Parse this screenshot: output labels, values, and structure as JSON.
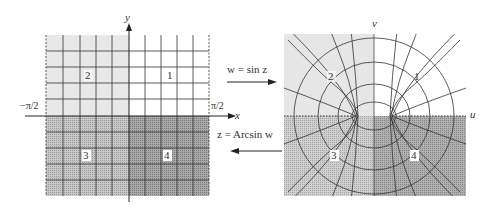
{
  "figure": {
    "left_plane": {
      "name": "z-plane",
      "x_axis_label": "x",
      "y_axis_label": "y",
      "left_bound_label": "−π/2",
      "right_bound_label": "π/2",
      "quadrants": [
        "1",
        "2",
        "3",
        "4"
      ]
    },
    "right_plane": {
      "name": "w-plane",
      "u_axis_label": "u",
      "v_axis_label": "v",
      "quadrants": [
        "1",
        "2",
        "3",
        "4"
      ]
    },
    "forward_map": {
      "label": "w = sin z",
      "direction": "right"
    },
    "inverse_map": {
      "label": "z = Arcsin w",
      "direction": "left"
    },
    "colors": {
      "light_region": "#e6e6e6",
      "white_region": "#ffffff",
      "medium_region": "#bdbdbd",
      "dark_region": "#a8a8a8",
      "grid_line": "#333333"
    }
  }
}
